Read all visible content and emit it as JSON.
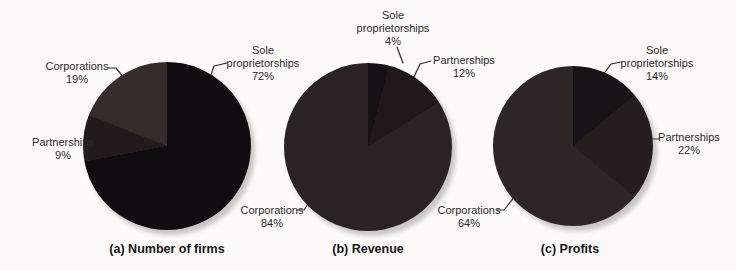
{
  "figure": {
    "background": "#fcfbfa",
    "label_text_color": "#2c2a2b",
    "caption_text_color": "#171516",
    "leader_line_color": "#2a2829"
  },
  "chart_data": [
    {
      "type": "pie",
      "caption": "(a) Number of firms",
      "unit": "%",
      "direction": "clockwise-from-top",
      "slices": [
        {
          "label": "Sole proprietorships",
          "value": 72,
          "display_lines": [
            "Sole",
            "proprietorships",
            "72%"
          ],
          "color": "#0f0d10"
        },
        {
          "label": "Partnerships",
          "value": 9,
          "display_lines": [
            "Partnerships",
            "9%"
          ],
          "color": "#231a1c"
        },
        {
          "label": "Corporations",
          "value": 19,
          "display_lines": [
            "Corporations",
            "19%"
          ],
          "color": "#362d2a"
        }
      ]
    },
    {
      "type": "pie",
      "caption": "(b) Revenue",
      "unit": "%",
      "direction": "clockwise-from-top",
      "slices": [
        {
          "label": "Sole proprietorships",
          "value": 4,
          "display_lines": [
            "Sole",
            "proprietorships",
            "4%"
          ],
          "color": "#151114"
        },
        {
          "label": "Partnerships",
          "value": 12,
          "display_lines": [
            "Partnerships",
            "12%"
          ],
          "color": "#211819"
        },
        {
          "label": "Corporations",
          "value": 84,
          "display_lines": [
            "Corporations",
            "84%"
          ],
          "color": "#2b2224"
        }
      ]
    },
    {
      "type": "pie",
      "caption": "(c) Profits",
      "unit": "%",
      "direction": "clockwise-from-top",
      "slices": [
        {
          "label": "Sole proprietorships",
          "value": 14,
          "display_lines": [
            "Sole",
            "proprietorships",
            "14%"
          ],
          "color": "#181316"
        },
        {
          "label": "Partnerships",
          "value": 22,
          "display_lines": [
            "Partnerships",
            "22%"
          ],
          "color": "#261d1f"
        },
        {
          "label": "Corporations",
          "value": 64,
          "display_lines": [
            "Corporations",
            "64%"
          ],
          "color": "#2e2527"
        }
      ]
    }
  ]
}
